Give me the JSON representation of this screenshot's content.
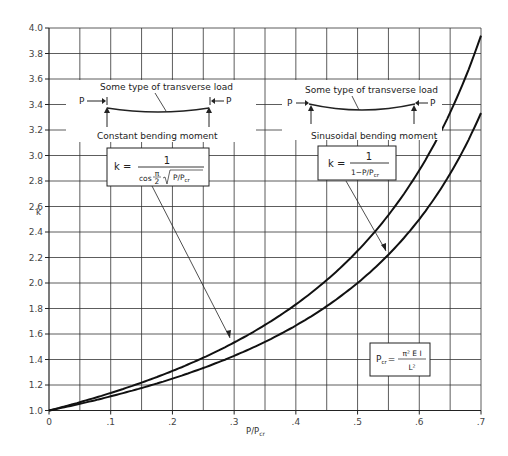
{
  "chart_data": {
    "type": "line",
    "title": "",
    "xlabel": "P/Pcr",
    "ylabel": "k",
    "xlim": [
      0,
      0.7
    ],
    "ylim": [
      1.0,
      4.0
    ],
    "grid": true,
    "x_ticks": [
      {
        "value": 0,
        "label": "0"
      },
      {
        "value": 0.1,
        "label": ".1"
      },
      {
        "value": 0.2,
        "label": ".2"
      },
      {
        "value": 0.3,
        "label": ".3"
      },
      {
        "value": 0.4,
        "label": ".4"
      },
      {
        "value": 0.5,
        "label": ".5"
      },
      {
        "value": 0.6,
        "label": ".6"
      },
      {
        "value": 0.7,
        "label": ".7"
      }
    ],
    "y_ticks": [
      {
        "value": 1.0,
        "label": "1.0"
      },
      {
        "value": 1.2,
        "label": "1.2"
      },
      {
        "value": 1.4,
        "label": "1.4"
      },
      {
        "value": 1.6,
        "label": "1.6"
      },
      {
        "value": 1.8,
        "label": "1.8"
      },
      {
        "value": 2.0,
        "label": "2.0"
      },
      {
        "value": 2.2,
        "label": "2.2"
      },
      {
        "value": 2.4,
        "label": "2.4"
      },
      {
        "value": 2.6,
        "label": "2.6"
      },
      {
        "value": 2.8,
        "label": "2.8"
      },
      {
        "value": 3.0,
        "label": "3.0"
      },
      {
        "value": 3.2,
        "label": "3.2"
      },
      {
        "value": 3.4,
        "label": "3.4"
      },
      {
        "value": 3.6,
        "label": "3.6"
      },
      {
        "value": 3.8,
        "label": "3.8"
      },
      {
        "value": 4.0,
        "label": "4.0"
      }
    ],
    "x": [
      0,
      0.05,
      0.1,
      0.15,
      0.2,
      0.25,
      0.3,
      0.35,
      0.4,
      0.45,
      0.5,
      0.55,
      0.6,
      0.65,
      0.7
    ],
    "series": [
      {
        "name": "Constant bending moment",
        "formula": "k = 1 / cos(π/2 · √(P/Pcr))",
        "values": [
          1.0,
          1.067,
          1.139,
          1.218,
          1.303,
          1.397,
          1.5,
          1.616,
          1.746,
          1.895,
          2.252,
          2.49,
          2.783,
          3.252,
          3.94
        ]
      },
      {
        "name": "Sinusoidal bending moment",
        "formula": "k = 1 / (1 − P/Pcr)",
        "values": [
          1.0,
          1.053,
          1.111,
          1.176,
          1.25,
          1.333,
          1.429,
          1.538,
          1.667,
          1.818,
          2.0,
          2.222,
          2.5,
          2.857,
          3.333
        ]
      }
    ],
    "annotations": {
      "left_diagram": {
        "load_label": "Some type of transverse load",
        "force_left": "P",
        "force_right": "P",
        "caption": "Constant bending moment",
        "formula": {
          "lhs": "k =",
          "numerator": "1",
          "denominator_prefix": "cos",
          "pi_num": "π",
          "pi_den": "2",
          "radicand": "P/P",
          "radicand_sub": "cr"
        }
      },
      "right_diagram": {
        "load_label": "Some type of transverse load",
        "force_left": "P",
        "force_right": "P",
        "caption": "Sinusoidal bending moment",
        "formula": {
          "lhs": "k =",
          "numerator": "1",
          "denominator": "1−P/P",
          "denominator_sub": "cr"
        }
      },
      "pcr_box": {
        "lhs": "P",
        "lhs_sub": "cr",
        "eq": "=",
        "numerator": "π² E I",
        "denominator": "L²"
      }
    }
  }
}
